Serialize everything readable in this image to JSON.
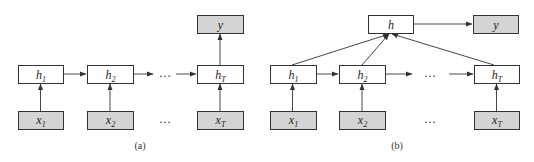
{
  "colors": {
    "hidden_fill": "#ffffff",
    "io_fill": "#d4d4d4",
    "stroke": "#333333"
  },
  "diagram_a": {
    "caption": "(a)",
    "hidden": [
      {
        "base": "h",
        "sub": "1"
      },
      {
        "base": "h",
        "sub": "2"
      },
      {
        "base": "h",
        "sub": "T"
      }
    ],
    "inputs": [
      {
        "base": "x",
        "sub": "1"
      },
      {
        "base": "x",
        "sub": "2"
      },
      {
        "base": "x",
        "sub": "T"
      }
    ],
    "output": {
      "base": "y"
    },
    "ellipsis": "…"
  },
  "diagram_b": {
    "caption": "(b)",
    "aggregate": {
      "base": "h"
    },
    "hidden": [
      {
        "base": "h",
        "sub": "1"
      },
      {
        "base": "h",
        "sub": "2"
      },
      {
        "base": "h",
        "sub": "T"
      }
    ],
    "inputs": [
      {
        "base": "x",
        "sub": "1"
      },
      {
        "base": "x",
        "sub": "2"
      },
      {
        "base": "x",
        "sub": "T"
      }
    ],
    "output": {
      "base": "y"
    },
    "ellipsis": "…"
  }
}
